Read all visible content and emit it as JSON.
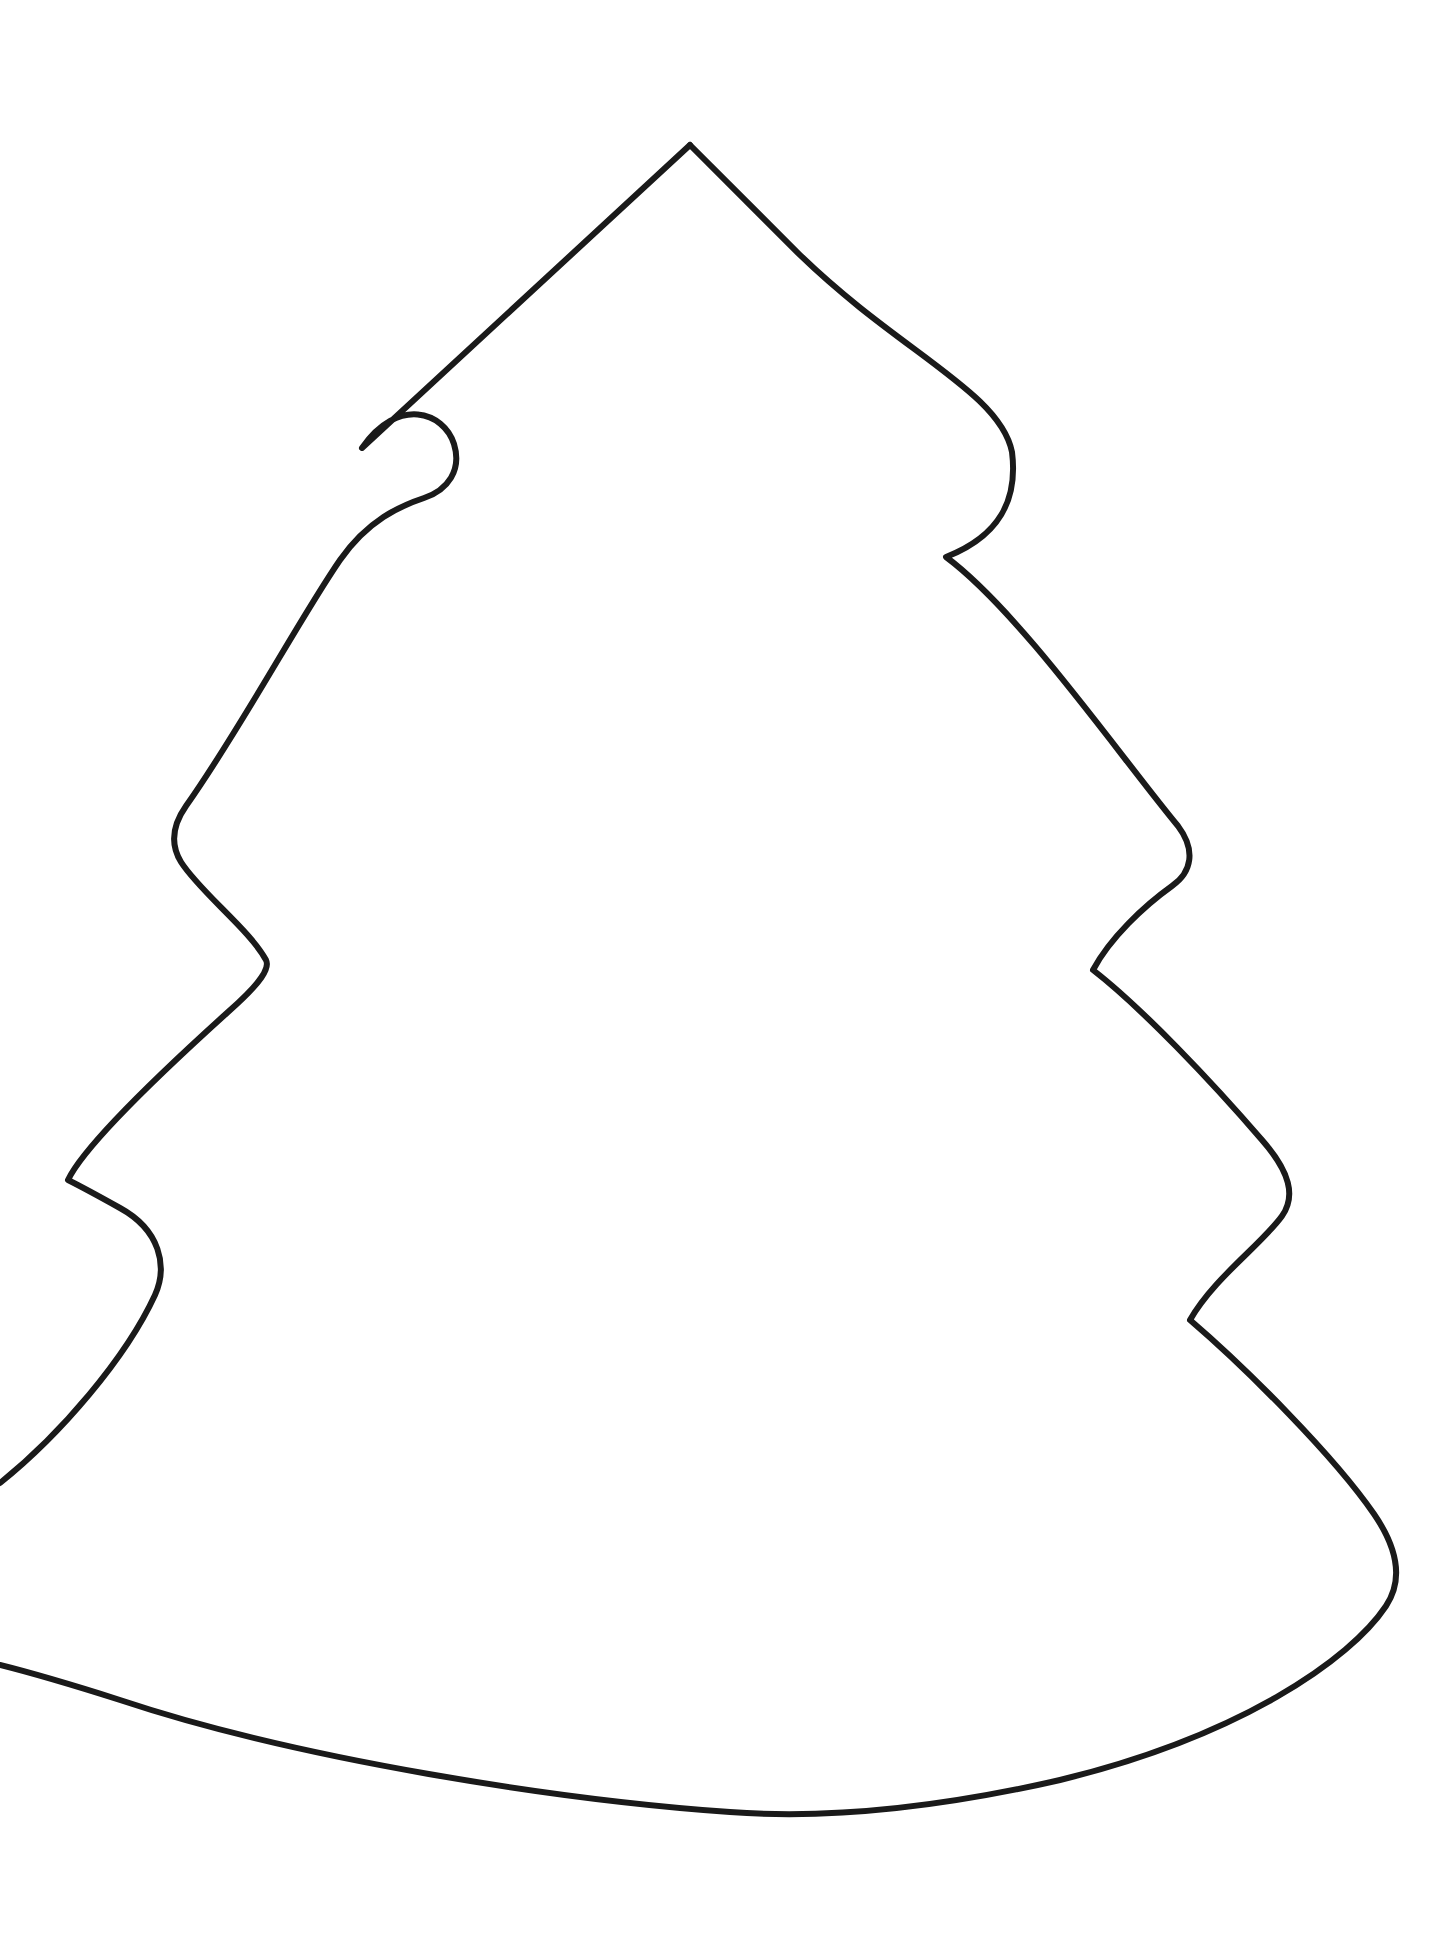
{
  "document": {
    "kind": "line-drawing",
    "subject": "christmas-tree-outline",
    "title": "Christmas Tree Outline Template",
    "background_color": "#ffffff",
    "stroke_color": "#1a1a1a",
    "stroke_width": 6,
    "canvas": {
      "width": 1448,
      "height": 1935
    },
    "text_content": "",
    "fill": "none",
    "notes": "Single hand-drawn closed-ish contour of a four-tier conifer; the contour is broken at the left page edge between the lowest bough tip and the trunk/skirt sweep."
  },
  "shape": {
    "name": "tree-outline",
    "tier_count": 4,
    "apex": {
      "x": 690,
      "y": 145
    },
    "lowest_point": {
      "x": 730,
      "y": 1812
    },
    "bough_tips": [
      {
        "side": "left",
        "tier": 1,
        "x": 362,
        "y": 448
      },
      {
        "side": "right",
        "tier": 1,
        "x": 1012,
        "y": 460
      },
      {
        "side": "left",
        "tier": 2,
        "x": 176,
        "y": 838
      },
      {
        "side": "right",
        "tier": 2,
        "x": 1188,
        "y": 855
      },
      {
        "side": "left",
        "tier": 3,
        "x": 68,
        "y": 1180
      },
      {
        "side": "right",
        "tier": 3,
        "x": 1290,
        "y": 1190
      },
      {
        "side": "right",
        "tier": 4,
        "x": 1388,
        "y": 1565
      }
    ],
    "waists": [
      {
        "side": "left",
        "between": "1-2",
        "x": 424,
        "y": 557
      },
      {
        "side": "right",
        "between": "1-2",
        "x": 946,
        "y": 557
      },
      {
        "side": "left",
        "between": "2-3",
        "x": 266,
        "y": 960
      },
      {
        "side": "right",
        "between": "2-3",
        "x": 1093,
        "y": 970
      },
      {
        "side": "left",
        "between": "3-4",
        "x": 155,
        "y": 1295
      },
      {
        "side": "right",
        "between": "3-4",
        "x": 1190,
        "y": 1320
      }
    ],
    "edge_exits": [
      {
        "label": "left-upper-exit",
        "x": 0,
        "y": 1483
      },
      {
        "label": "left-lower-exit",
        "x": 0,
        "y": 1665
      }
    ],
    "path_main": "M 690 145 L 800 255 C 900 352 1000 392 1012 452 C 1018 500 1000 536 946 557 C 1020 612 1120 756 1178 826 C 1196 850 1192 872 1172 886 C 1144 906 1110 938 1093 970 C 1142 1008 1212 1082 1262 1140 C 1290 1172 1296 1196 1282 1216 C 1262 1244 1214 1278 1190 1320 C 1246 1368 1334 1456 1374 1514 C 1400 1552 1402 1582 1386 1606 C 1350 1660 1240 1736 1060 1780 C 920 1812 810 1818 730 1812 C 560 1800 300 1760 120 1700 C 60 1681 20 1670 0 1665",
    "path_left": "M 0 1483 C 60 1435 126 1358 155 1295 C 168 1266 160 1230 120 1208 C 86 1189 68 1180 68 1180 C 84 1146 166 1068 228 1012 C 262 982 270 968 266 960 C 250 930 200 892 181 862 C 170 844 172 826 186 806 C 240 730 300 618 340 560 C 368 520 400 506 424 498 C 448 490 462 470 454 444 C 444 412 398 396 362 448 L 690 145"
  },
  "palette": {
    "background": "#ffffff",
    "ink": "#1a1a1a"
  }
}
